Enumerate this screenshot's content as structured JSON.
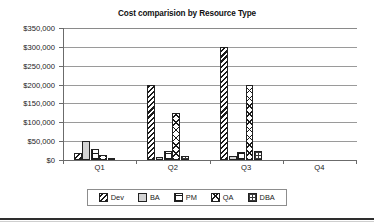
{
  "chart_data": {
    "type": "bar",
    "title": "Cost comparision by Resource Type",
    "xlabel": "",
    "ylabel": "",
    "categories": [
      "Q1",
      "Q2",
      "Q3",
      "Q4"
    ],
    "series": [
      {
        "name": "Dev",
        "pattern": "diagonal-hatch",
        "values": [
          18000,
          200000,
          300000,
          0
        ]
      },
      {
        "name": "BA",
        "pattern": "solid-light-gray",
        "values": [
          50000,
          8000,
          10000,
          0
        ]
      },
      {
        "name": "PM",
        "pattern": "horizontal-brick",
        "values": [
          30000,
          25000,
          22000,
          0
        ]
      },
      {
        "name": "QA",
        "pattern": "crosshatch",
        "values": [
          12000,
          125000,
          200000,
          0
        ]
      },
      {
        "name": "DBA",
        "pattern": "fine-dotted-grid",
        "values": [
          2000,
          10000,
          25000,
          0
        ]
      }
    ],
    "ylim": [
      0,
      350000
    ],
    "ytick_values": [
      0,
      50000,
      100000,
      150000,
      200000,
      250000,
      300000,
      350000
    ],
    "ytick_labels": [
      "$0",
      "$50,000",
      "$100,000",
      "$150,000",
      "$200,000",
      "$250,000",
      "$300,000",
      "$350,000"
    ],
    "grid": true,
    "legend_position": "bottom",
    "legend_entries": [
      "Dev",
      "BA",
      "PM",
      "QA",
      "DBA"
    ],
    "colors": {
      "plot_background": "#ffffff",
      "gridline": "#9a9a9a",
      "axis": "#6b6b6b",
      "bar_outline": "#222222",
      "ba_fill": "#d4d4d4",
      "text": "#1a1a1a",
      "bottom_rule": "#2e2e2e"
    }
  }
}
